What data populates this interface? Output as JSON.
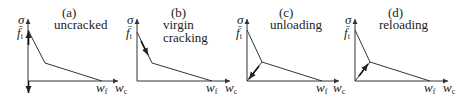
{
  "figure": {
    "panels": [
      {
        "id": "a",
        "tag": "(a)",
        "caption_lines": [
          "uncracked"
        ],
        "y_label": "σ",
        "peak_label": "f̄",
        "peak_sub": "t",
        "wf_label": "w",
        "wf_sub": "f",
        "wc_label": "w",
        "wc_sub": "c"
      },
      {
        "id": "b",
        "tag": "(b)",
        "caption_lines": [
          "virgin",
          "cracking"
        ],
        "y_label": "σ",
        "peak_label": "f̄",
        "peak_sub": "t",
        "wf_label": "w",
        "wf_sub": "f",
        "wc_label": "w",
        "wc_sub": "c"
      },
      {
        "id": "c",
        "tag": "(c)",
        "caption_lines": [
          "unloading"
        ],
        "y_label": "σ",
        "peak_label": "f̄",
        "peak_sub": "t",
        "wf_label": "w",
        "wf_sub": "f",
        "wc_label": "w",
        "wc_sub": "c"
      },
      {
        "id": "d",
        "tag": "(d)",
        "caption_lines": [
          "reloading"
        ],
        "y_label": "σ",
        "peak_label": "f̄",
        "peak_sub": "t",
        "wf_label": "w",
        "wf_sub": "f",
        "wc_label": "w",
        "wc_sub": "c"
      }
    ],
    "colors": {
      "line": "#333333",
      "text": "#222222",
      "background": "#ffffff"
    }
  }
}
